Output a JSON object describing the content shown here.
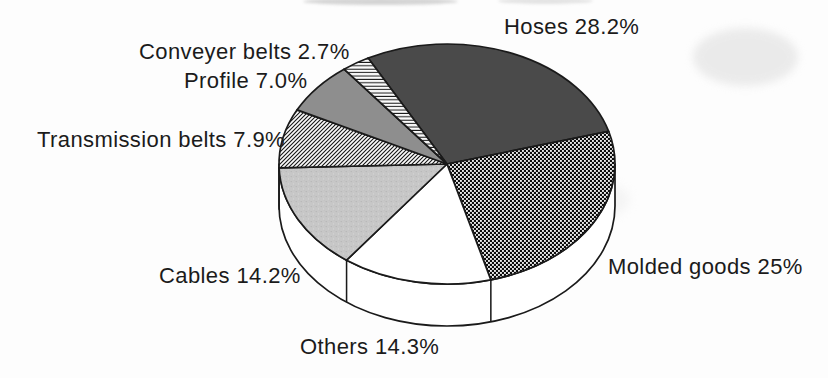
{
  "figure": {
    "kind": "scanned-book-figure",
    "background_color": "#fdfdfd",
    "outline_color": "#1a1a1a",
    "text_color": "#1b1b1b"
  },
  "chart_data": {
    "type": "pie",
    "style": "3d-exploded-none-grayscale-patterns",
    "legend_position": "none",
    "labels_position": "outside",
    "total_percent": 99.3,
    "slices": [
      {
        "label": "Hoses",
        "value": 28.2,
        "display": "Hoses 28.2%",
        "pattern": "solid-dark-gray",
        "fill_hint": "#4a4a4a"
      },
      {
        "label": "Molded goods",
        "value": 25,
        "display": "Molded goods 25%",
        "pattern": "dotted-black-checker",
        "fill_hint": "#111111"
      },
      {
        "label": "Others",
        "value": 14.3,
        "display": "Others 14.3%",
        "pattern": "white",
        "fill_hint": "#ffffff"
      },
      {
        "label": "Cables",
        "value": 14.2,
        "display": "Cables 14.2%",
        "pattern": "light-gray-stipple",
        "fill_hint": "#c6c6c6"
      },
      {
        "label": "Transmission belts",
        "value": 7.9,
        "display": "Transmission belts 7.9%",
        "pattern": "diagonal-hatch",
        "fill_hint": "#fbfbfb"
      },
      {
        "label": "Profile",
        "value": 7.0,
        "display": "Profile 7.0%",
        "pattern": "solid-medium-gray",
        "fill_hint": "#8e8e8e"
      },
      {
        "label": "Conveyer belts",
        "value": 2.7,
        "display": "Conveyer belts 2.7%",
        "pattern": "horizontal-hatch",
        "fill_hint": "#fbfbfb"
      }
    ]
  }
}
